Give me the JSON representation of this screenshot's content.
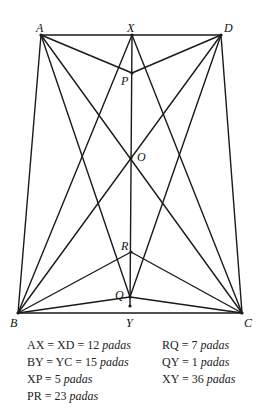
{
  "diagram": {
    "points": {
      "A": {
        "x": 41,
        "y": 35,
        "label": "A",
        "lx": 36,
        "ly": 22
      },
      "X": {
        "x": 132,
        "y": 35,
        "label": "X",
        "lx": 127,
        "ly": 22
      },
      "D": {
        "x": 221,
        "y": 35,
        "label": "D",
        "lx": 224,
        "ly": 22
      },
      "P": {
        "x": 132,
        "y": 73,
        "label": "P",
        "lx": 121,
        "ly": 75
      },
      "O": {
        "x": 131,
        "y": 158,
        "label": "O",
        "lx": 137,
        "ly": 151
      },
      "R": {
        "x": 131,
        "y": 252,
        "label": "R",
        "lx": 121,
        "ly": 240
      },
      "Q": {
        "x": 130,
        "y": 297,
        "label": "Q",
        "lx": 115,
        "ly": 289
      },
      "B": {
        "x": 18,
        "y": 313,
        "label": "B",
        "lx": 10,
        "ly": 317
      },
      "Y": {
        "x": 130,
        "y": 306,
        "label": "Y",
        "lx": 126,
        "ly": 317
      },
      "C": {
        "x": 242,
        "y": 313,
        "label": "C",
        "lx": 244,
        "ly": 317
      }
    },
    "segments": [
      [
        "A",
        "D"
      ],
      [
        "A",
        "B"
      ],
      [
        "D",
        "C"
      ],
      [
        "B",
        "C"
      ],
      [
        "X",
        "Y"
      ],
      [
        "A",
        "P"
      ],
      [
        "D",
        "P"
      ],
      [
        "A",
        "C"
      ],
      [
        "D",
        "B"
      ],
      [
        "A",
        "Q"
      ],
      [
        "D",
        "Q"
      ],
      [
        "X",
        "B"
      ],
      [
        "X",
        "C"
      ],
      [
        "B",
        "R"
      ],
      [
        "C",
        "R"
      ],
      [
        "B",
        "Q"
      ],
      [
        "C",
        "Q"
      ]
    ]
  },
  "measurements": {
    "left": [
      {
        "lhs": "AX = XD = 12",
        "unit": "padas"
      },
      {
        "lhs": "BY = YC = 15",
        "unit": "padas"
      },
      {
        "lhs": "XP = 5",
        "unit": "padas"
      },
      {
        "lhs": "PR = 23",
        "unit": "padas"
      }
    ],
    "right": [
      {
        "lhs": "RQ = 7",
        "unit": "padas"
      },
      {
        "lhs": "QY = 1",
        "unit": "padas"
      },
      {
        "lhs": "XY = 36",
        "unit": "padas"
      }
    ]
  }
}
